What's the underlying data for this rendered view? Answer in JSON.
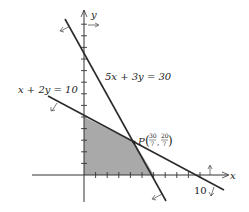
{
  "diagram": {
    "type": "linear-programming-feasible-region",
    "axes": {
      "x_label": "x",
      "y_label": "y",
      "x_tick_label": "10"
    },
    "constraints": [
      {
        "equation": "5x + 3y = 30",
        "x_intercept": 6,
        "y_intercept": 10
      },
      {
        "equation": "x + 2y = 10",
        "x_intercept": 10,
        "y_intercept": 5
      }
    ],
    "labels": {
      "line1": "5x + 3y = 30",
      "line2": "x + 2y = 10",
      "point_name": "P",
      "point_x_num": "30",
      "point_x_den": "7",
      "point_y_num": "20",
      "point_y_den": "7",
      "tick10": "10"
    },
    "intersection": {
      "name": "P",
      "x": "30/7",
      "y": "20/7"
    },
    "feasible_region_vertices": [
      [
        0,
        0
      ],
      [
        0,
        5
      ],
      [
        "30/7",
        "20/7"
      ],
      [
        6,
        0
      ]
    ],
    "colors": {
      "shade": "#a8a8a8",
      "line": "#2b2b2b",
      "axis": "#333333"
    }
  }
}
